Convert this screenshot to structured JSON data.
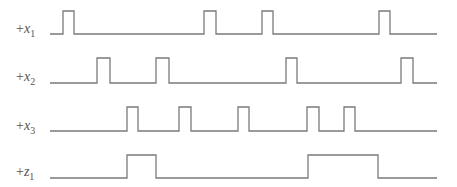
{
  "diagram": {
    "type": "timing-diagram",
    "line_color": "#7a7a7a",
    "label_color": "#555555",
    "x_start": 50,
    "x_end": 437,
    "signals": [
      {
        "name": "x1",
        "sign": "+",
        "var": "x",
        "sub": "1",
        "label_y": 33,
        "low_y": 34,
        "high_y": 11,
        "pulses": [
          [
            63,
            74
          ],
          [
            204,
            216
          ],
          [
            262,
            273
          ],
          [
            379,
            390
          ]
        ]
      },
      {
        "name": "x2",
        "sign": "+",
        "var": "x",
        "sub": "2",
        "label_y": 81,
        "low_y": 83,
        "high_y": 58,
        "pulses": [
          [
            97,
            110
          ],
          [
            156,
            169
          ],
          [
            286,
            297
          ],
          [
            401,
            413
          ]
        ]
      },
      {
        "name": "x3",
        "sign": "+",
        "var": "x",
        "sub": "3",
        "label_y": 130,
        "low_y": 131,
        "high_y": 107,
        "pulses": [
          [
            127,
            138
          ],
          [
            179,
            191
          ],
          [
            238,
            249
          ],
          [
            307,
            319
          ],
          [
            344,
            355
          ]
        ]
      },
      {
        "name": "z1",
        "sign": "+",
        "var": "z",
        "sub": "1",
        "label_y": 176,
        "low_y": 178,
        "high_y": 155,
        "pulses": [
          [
            127,
            156
          ],
          [
            308,
            378
          ]
        ]
      }
    ]
  }
}
